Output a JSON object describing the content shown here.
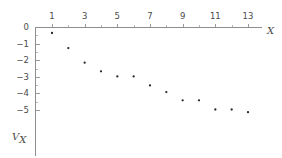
{
  "chart_data": {
    "type": "scatter",
    "title": "",
    "xlabel": "X",
    "ylabel": "V_X",
    "ylabel_base": "V",
    "ylabel_sub": "X",
    "xlim": [
      0,
      14.6
    ],
    "ylim": [
      -5.75,
      0.35
    ],
    "grid": false,
    "legend": null,
    "x_ticks_major": [
      1,
      3,
      5,
      7,
      9,
      11,
      13
    ],
    "x_tick_labels": [
      "1",
      "3",
      "5",
      "7",
      "9",
      "11",
      "13"
    ],
    "x_ticks_minor": [
      2,
      4,
      6,
      8,
      10,
      12,
      14
    ],
    "y_ticks_major": [
      0,
      -1,
      -2,
      -3,
      -4,
      -5
    ],
    "y_tick_labels": [
      "0",
      "-1",
      "-2",
      "-3",
      "-4",
      "-5"
    ],
    "y_ticks_minor": [
      -0.5,
      -1.5,
      -2.5,
      -3.5,
      -4.5
    ],
    "x": [
      1,
      2,
      3,
      4,
      5,
      6,
      7,
      8,
      9,
      10,
      11,
      12,
      13
    ],
    "values": [
      -0.36,
      -1.27,
      -2.15,
      -2.67,
      -2.98,
      -2.98,
      -3.52,
      -3.92,
      -4.42,
      -4.42,
      -4.97,
      -4.97,
      -5.13
    ],
    "point_color": "#2b2b2b",
    "axis_color": "#8e8e8e",
    "background": "#ffffff"
  },
  "axes": {
    "x_axis_name": "X",
    "y_axis_name_base": "V",
    "y_axis_name_sub": "X"
  }
}
